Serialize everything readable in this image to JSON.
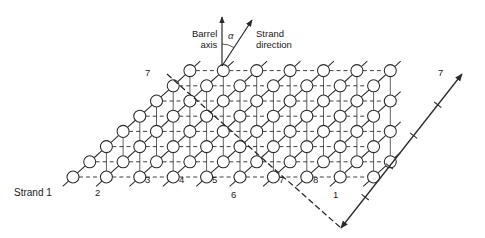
{
  "figure": {
    "type": "beta-barrel-unrolled-lattice",
    "background": "#ffffff",
    "ink": "#2b2b2b"
  },
  "inset": {
    "barrel_axis_label_line1": "Barrel",
    "barrel_axis_label_line2": "axis",
    "strand_direction_label_line1": "Strand",
    "strand_direction_label_line2": "direction",
    "angle_symbol": "α",
    "barrel_axis_arrow": {
      "x1": 222,
      "y1": 66,
      "x2": 222,
      "y2": 17
    },
    "strand_direction_arrow": {
      "x1": 222,
      "y1": 66,
      "x2": 252,
      "y2": 20
    },
    "angle_arc": {
      "cx": 222,
      "cy": 66,
      "r": 22,
      "start_deg": 90,
      "end_deg": 57
    }
  },
  "strand_labels": [
    {
      "text": "Strand 1",
      "x": 14,
      "y": 188
    },
    {
      "text": "2",
      "x": 95,
      "y": 188
    },
    {
      "text": "3",
      "x": 145,
      "y": 175
    },
    {
      "text": "4",
      "x": 179,
      "y": 175
    },
    {
      "text": "5",
      "x": 212,
      "y": 175
    },
    {
      "text": "6",
      "x": 231,
      "y": 190
    },
    {
      "text": "7",
      "x": 279,
      "y": 175
    },
    {
      "text": "8",
      "x": 313,
      "y": 175
    },
    {
      "text": "1",
      "x": 333,
      "y": 190
    },
    {
      "text": "7",
      "x": 145,
      "y": 68
    },
    {
      "text": "7",
      "x": 438,
      "y": 68
    }
  ],
  "shear_marker": {
    "dashed_line": {
      "x1": 167,
      "y1": 74,
      "x2": 341,
      "y2": 228
    },
    "arrow_line": {
      "x1": 341,
      "y1": 228,
      "x2": 462,
      "y2": 74
    },
    "tick_count": 4,
    "dash_pattern": "6 3"
  },
  "lattice_geometry": {
    "circle_radius": 6,
    "col_spacing_x": 33.4,
    "row_spacing_y": 15.2,
    "row_shift_x": 16.7,
    "origin": {
      "x": 73,
      "y": 177
    },
    "rows": 8,
    "cols": 14,
    "note": "sheared grid; solid lines up-right along strands, dashed horizontal hydrogen bonds, thin vertical connectors"
  }
}
